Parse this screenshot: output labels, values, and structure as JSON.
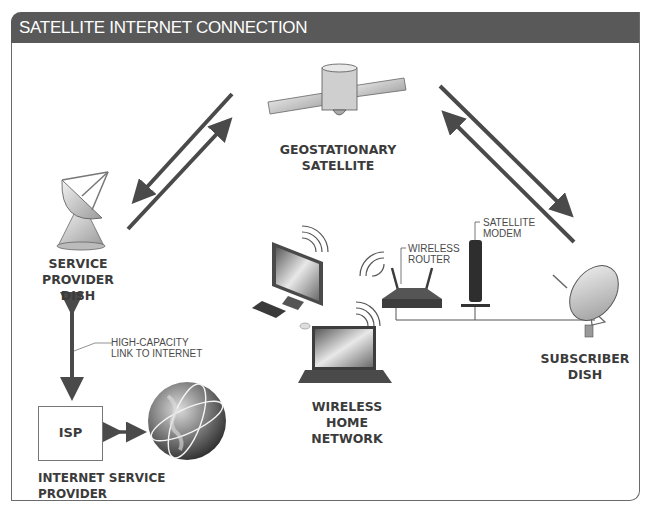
{
  "header": {
    "title": "SATELLITE INTERNET CONNECTION"
  },
  "nodes": {
    "satellite": {
      "line1": "GEOSTATIONARY",
      "line2": "SATELLITE",
      "icon": "satellite-icon"
    },
    "service_provider_dish": {
      "line1": "SERVICE",
      "line2": "PROVIDER",
      "line3": "DISH",
      "icon": "satellite-dish-icon"
    },
    "subscriber_dish": {
      "line1": "SUBSCRIBER",
      "line2": "DISH",
      "icon": "satellite-dish-icon"
    },
    "home_network": {
      "line1": "WIRELESS",
      "line2": "HOME NETWORK",
      "icon": "computer-icon"
    },
    "isp": {
      "box_label": "ISP",
      "caption": "INTERNET SERVICE PROVIDER",
      "icon": "globe-icon"
    }
  },
  "callouts": {
    "high_capacity": {
      "line1": "HIGH-CAPACITY",
      "line2": "LINK TO INTERNET"
    },
    "wireless_router": {
      "line1": "WIRELESS",
      "line2": "ROUTER"
    },
    "satellite_modem": {
      "line1": "SATELLITE",
      "line2": "MODEM"
    }
  },
  "colors": {
    "header_bg": "#595959",
    "arrow": "#4a4a4a",
    "text": "#3b3b3b",
    "border": "#6a6a6a"
  }
}
